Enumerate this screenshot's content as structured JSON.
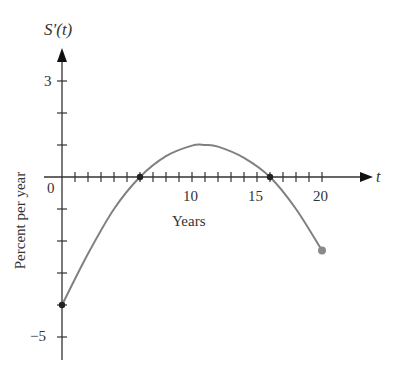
{
  "chart_data": {
    "type": "line",
    "title": "",
    "ylabel_top": "S′(t)",
    "xlabel_axis": "t",
    "xlabel": "Years",
    "ylabel": "Percent per year",
    "xlim": [
      0,
      20
    ],
    "ylim": [
      -5,
      3
    ],
    "x_tick_labels": [
      "0",
      "10",
      "15",
      "20"
    ],
    "y_tick_labels": [
      "3",
      "−5"
    ],
    "x_minor_ticks_every": 1,
    "y_minor_ticks_every": 1,
    "grid": false,
    "series": [
      {
        "name": "S'(t)",
        "color": "#808080",
        "x": [
          0,
          2,
          4,
          6,
          8,
          10,
          11,
          12,
          14,
          16,
          18,
          20
        ],
        "values": [
          -4,
          -2.4,
          -1.0,
          0,
          0.65,
          0.98,
          1.0,
          0.95,
          0.6,
          0,
          -1.0,
          -2.3
        ]
      }
    ],
    "marked_points": [
      {
        "x": 0,
        "y": -4,
        "style": "filled-dark"
      },
      {
        "x": 6,
        "y": 0,
        "style": "filled-dark"
      },
      {
        "x": 16,
        "y": 0,
        "style": "filled-dark"
      },
      {
        "x": 20,
        "y": -2.3,
        "style": "filled-gray"
      }
    ]
  }
}
